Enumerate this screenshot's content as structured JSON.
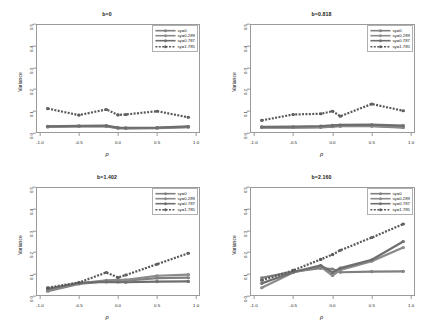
{
  "figure": {
    "panel_rows": 2,
    "panel_cols": 2,
    "background": "#ffffff",
    "axis_color": "#9a9a9a"
  },
  "axes": {
    "xlabel": "ρ",
    "ylabel": "Variance",
    "xticks": [
      "-1.0",
      "-0.5",
      "0.0",
      "0.5",
      "1.0"
    ],
    "xtick_values": [
      -1.0,
      -0.5,
      0.0,
      0.5,
      1.0
    ],
    "yticks": [
      "0.0",
      "0.1",
      "0.2",
      "0.3",
      "0.4",
      "0.5"
    ],
    "ytick_values": [
      0.0,
      0.1,
      0.2,
      0.3,
      0.4,
      0.5
    ],
    "xlim": [
      -1.05,
      1.05
    ],
    "ylim": [
      0.0,
      0.5
    ]
  },
  "legend": {
    "position": "top-right",
    "entries": [
      {
        "label": "sy=0",
        "color": "#7f7f7f",
        "dash": "none",
        "marker": "circle"
      },
      {
        "label": "sy=0.289",
        "color": "#8a8a8a",
        "dash": "none",
        "marker": "circle"
      },
      {
        "label": "sy=0.787",
        "color": "#6e6e6e",
        "dash": "none",
        "marker": "circle"
      },
      {
        "label": "sy=1.785",
        "color": "#5a5a5a",
        "dash": "2,1.4",
        "marker": "circle"
      }
    ]
  },
  "chart_data": [
    {
      "type": "line",
      "title": "b=0",
      "xlabel": "ρ",
      "ylabel": "Variance",
      "xlim": [
        -1.05,
        1.05
      ],
      "ylim": [
        0.0,
        0.5
      ],
      "grid": false,
      "legend_position": "top-right",
      "x": [
        -0.9,
        -0.5,
        -0.15,
        0.0,
        0.1,
        0.5,
        0.9
      ],
      "series": [
        {
          "name": "sy=0",
          "values": [
            0.028,
            0.03,
            0.03,
            0.022,
            0.021,
            0.022,
            0.027
          ]
        },
        {
          "name": "sy=0.289",
          "values": [
            0.029,
            0.031,
            0.031,
            0.023,
            0.022,
            0.023,
            0.028
          ]
        },
        {
          "name": "sy=0.787",
          "values": [
            0.031,
            0.033,
            0.034,
            0.025,
            0.024,
            0.025,
            0.03
          ]
        },
        {
          "name": "sy=1.785",
          "values": [
            0.112,
            0.082,
            0.108,
            0.083,
            0.085,
            0.1,
            0.072
          ]
        }
      ]
    },
    {
      "type": "line",
      "title": "b=0.818",
      "xlabel": "ρ",
      "ylabel": "Variance",
      "xlim": [
        -1.05,
        1.05
      ],
      "ylim": [
        0.0,
        0.5
      ],
      "grid": false,
      "legend_position": "top-right",
      "x": [
        -0.9,
        -0.5,
        -0.15,
        0.0,
        0.1,
        0.5,
        0.9
      ],
      "series": [
        {
          "name": "sy=0",
          "values": [
            0.025,
            0.025,
            0.026,
            0.029,
            0.031,
            0.031,
            0.025
          ]
        },
        {
          "name": "sy=0.289",
          "values": [
            0.026,
            0.026,
            0.028,
            0.031,
            0.033,
            0.033,
            0.027
          ]
        },
        {
          "name": "sy=0.787",
          "values": [
            0.028,
            0.029,
            0.032,
            0.035,
            0.037,
            0.038,
            0.034
          ]
        },
        {
          "name": "sy=1.785",
          "values": [
            0.058,
            0.085,
            0.088,
            0.1,
            0.077,
            0.133,
            0.102
          ]
        }
      ]
    },
    {
      "type": "line",
      "title": "b=1.402",
      "xlabel": "ρ",
      "ylabel": "Variance",
      "xlim": [
        -1.05,
        1.05
      ],
      "ylim": [
        0.0,
        0.5
      ],
      "grid": false,
      "legend_position": "top-right",
      "x": [
        -0.9,
        -0.5,
        -0.15,
        0.0,
        0.1,
        0.5,
        0.9
      ],
      "series": [
        {
          "name": "sy=0",
          "values": [
            0.022,
            0.055,
            0.068,
            0.069,
            0.07,
            0.082,
            0.084
          ]
        },
        {
          "name": "sy=0.289",
          "values": [
            0.026,
            0.058,
            0.072,
            0.074,
            0.074,
            0.093,
            0.098
          ]
        },
        {
          "name": "sy=0.787",
          "values": [
            0.033,
            0.06,
            0.065,
            0.064,
            0.063,
            0.066,
            0.067
          ]
        },
        {
          "name": "sy=1.785",
          "values": [
            0.038,
            0.062,
            0.108,
            0.085,
            0.096,
            0.146,
            0.196
          ]
        }
      ]
    },
    {
      "type": "line",
      "title": "b=2.160",
      "xlabel": "ρ",
      "ylabel": "Variance",
      "xlim": [
        -1.05,
        1.05
      ],
      "ylim": [
        0.0,
        0.5
      ],
      "grid": false,
      "legend_position": "top-right",
      "x": [
        -0.9,
        -0.5,
        -0.15,
        0.0,
        0.1,
        0.5,
        0.9
      ],
      "series": [
        {
          "name": "sy=0",
          "values": [
            0.083,
            0.112,
            0.128,
            0.124,
            0.109,
            0.112,
            0.113
          ]
        },
        {
          "name": "sy=0.289",
          "values": [
            0.038,
            0.108,
            0.135,
            0.094,
            0.12,
            0.16,
            0.222
          ]
        },
        {
          "name": "sy=0.787",
          "values": [
            0.058,
            0.11,
            0.14,
            0.108,
            0.128,
            0.166,
            0.25
          ]
        },
        {
          "name": "sy=1.785",
          "values": [
            0.072,
            0.118,
            0.168,
            0.19,
            0.21,
            0.268,
            0.33
          ]
        }
      ]
    }
  ]
}
